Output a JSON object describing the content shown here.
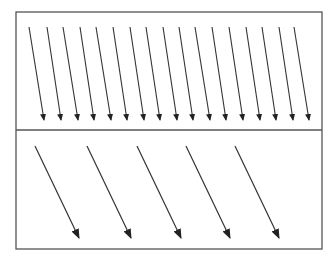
{
  "diagram": {
    "colors": {
      "stroke": "#333333",
      "frame": "#555555",
      "background": "#ffffff"
    },
    "frame": {
      "x": 16,
      "y": 12,
      "width": 306,
      "height": 237,
      "divider_y": 130
    },
    "panels": [
      {
        "name": "top",
        "arrow_count": 17,
        "arrows": [
          {
            "x1": 29,
            "y1": 27,
            "x2": 44,
            "y2": 120
          },
          {
            "x1": 47,
            "y1": 27,
            "x2": 61,
            "y2": 120
          },
          {
            "x1": 63,
            "y1": 27,
            "x2": 78,
            "y2": 120
          },
          {
            "x1": 80,
            "y1": 27,
            "x2": 94,
            "y2": 120
          },
          {
            "x1": 96,
            "y1": 27,
            "x2": 111,
            "y2": 120
          },
          {
            "x1": 113,
            "y1": 27,
            "x2": 127,
            "y2": 120
          },
          {
            "x1": 130,
            "y1": 27,
            "x2": 144,
            "y2": 120
          },
          {
            "x1": 146,
            "y1": 27,
            "x2": 160,
            "y2": 120
          },
          {
            "x1": 163,
            "y1": 27,
            "x2": 177,
            "y2": 120
          },
          {
            "x1": 179,
            "y1": 27,
            "x2": 193,
            "y2": 120
          },
          {
            "x1": 195,
            "y1": 27,
            "x2": 210,
            "y2": 120
          },
          {
            "x1": 212,
            "y1": 27,
            "x2": 226,
            "y2": 120
          },
          {
            "x1": 229,
            "y1": 27,
            "x2": 243,
            "y2": 120
          },
          {
            "x1": 246,
            "y1": 27,
            "x2": 260,
            "y2": 120
          },
          {
            "x1": 262,
            "y1": 27,
            "x2": 276,
            "y2": 120
          },
          {
            "x1": 279,
            "y1": 27,
            "x2": 293,
            "y2": 120
          },
          {
            "x1": 294,
            "y1": 27,
            "x2": 309,
            "y2": 120
          }
        ]
      },
      {
        "name": "bottom",
        "arrow_count": 5,
        "arrows": [
          {
            "x1": 35,
            "y1": 146,
            "x2": 79,
            "y2": 238
          },
          {
            "x1": 87,
            "y1": 146,
            "x2": 131,
            "y2": 238
          },
          {
            "x1": 137,
            "y1": 146,
            "x2": 181,
            "y2": 238
          },
          {
            "x1": 186,
            "y1": 146,
            "x2": 230,
            "y2": 238
          },
          {
            "x1": 235,
            "y1": 146,
            "x2": 279,
            "y2": 238
          }
        ]
      }
    ]
  }
}
